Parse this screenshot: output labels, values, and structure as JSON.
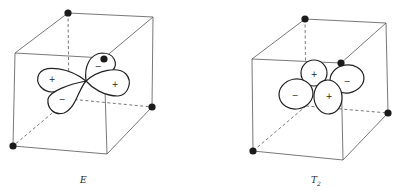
{
  "figure": {
    "panels": [
      {
        "label": "E",
        "description": "Tetrahedral ligand field in a cube; E set d-orbital (lobes pointing toward cube face centers, between ligands)",
        "signs": [
          "+",
          "−",
          "+",
          "−"
        ]
      },
      {
        "label": "T",
        "label_subscript": "2",
        "description": "Tetrahedral ligand field in a cube; T2 set d-orbital (lobes pointing toward cube edges, closer to ligands)",
        "signs": [
          "+",
          "−",
          "−",
          "+"
        ]
      }
    ],
    "colors": {
      "edge": "#555555",
      "lobe_outline": "#222222",
      "ligand": "#1a1a1a",
      "background": "#ffffff"
    }
  }
}
